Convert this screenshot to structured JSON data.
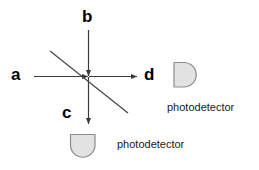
{
  "diagram": {
    "background_color": "#ffffff",
    "line_color": "#3a3a3a",
    "splitter_color": "#4a4a4a",
    "detector_fill": "#e2e2e2",
    "detector_stroke": "#8c8c8c",
    "text_color": "#000000",
    "ports": [
      {
        "id": "a",
        "label": "a",
        "direction": "rightward",
        "role": "input-beam"
      },
      {
        "id": "b",
        "label": "b",
        "direction": "downward",
        "role": "input-beam"
      },
      {
        "id": "c",
        "label": "c",
        "direction": "downward",
        "role": "output-beam"
      },
      {
        "id": "d",
        "label": "d",
        "direction": "rightward",
        "role": "output-beam"
      }
    ],
    "detectors": [
      {
        "id": "detector-d",
        "caption": "photodetector",
        "shape": "d-shape",
        "attached_port": "d"
      },
      {
        "id": "detector-c",
        "caption": "photodetector",
        "shape": "u-shape",
        "attached_port": "c"
      }
    ],
    "beam_splitter": {
      "label": "",
      "shape": "diagonal-line",
      "orientation": "down-right"
    }
  }
}
